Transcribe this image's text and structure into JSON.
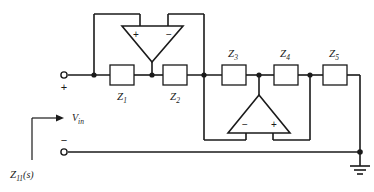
{
  "figure": {
    "type": "circuit-schematic",
    "background_color": "#ffffff",
    "line_color": "#1a1a1a"
  },
  "labels": {
    "input_voltage": "V",
    "input_voltage_sub": "in",
    "driving_point_impedance": "Z",
    "driving_point_impedance_sub": "11",
    "driving_point_impedance_arg": "(s)",
    "terminal_plus": "+",
    "terminal_minus": "−"
  },
  "impedances": [
    {
      "name": "Z1",
      "label": "Z",
      "subscript": "1",
      "label_position": "below",
      "x": 110,
      "y": 66,
      "w": 24,
      "h": 20
    },
    {
      "name": "Z2",
      "label": "Z",
      "subscript": "2",
      "label_position": "below",
      "x": 163,
      "y": 66,
      "w": 24,
      "h": 20
    },
    {
      "name": "Z3",
      "label": "Z",
      "subscript": "3",
      "label_position": "above",
      "x": 222,
      "y": 66,
      "w": 24,
      "h": 20
    },
    {
      "name": "Z4",
      "label": "Z",
      "subscript": "4",
      "label_position": "above",
      "x": 274,
      "y": 66,
      "w": 24,
      "h": 20
    },
    {
      "name": "Z5",
      "label": "Z",
      "subscript": "5",
      "label_position": "above",
      "x": 323,
      "y": 66,
      "w": 24,
      "h": 20
    }
  ],
  "opamps": [
    {
      "name": "opamp-top",
      "orientation": "pointing-down",
      "input_left": "+",
      "input_right": "−",
      "description": "Top operational amplifier, output at bottom apex feeding node between Z1 and Z2"
    },
    {
      "name": "opamp-bottom",
      "orientation": "pointing-up",
      "input_left": "−",
      "input_right": "+",
      "description": "Bottom operational amplifier, output at top apex feeding node between Z3 and Z4"
    }
  ],
  "nodes": [
    {
      "name": "node-input",
      "x": 94,
      "y": 75
    },
    {
      "name": "node-z1-z2",
      "x": 152,
      "y": 75
    },
    {
      "name": "node-z2-z3",
      "x": 204,
      "y": 75
    },
    {
      "name": "node-z3-z4",
      "x": 259,
      "y": 75
    },
    {
      "name": "node-z4-z5",
      "x": 310,
      "y": 75
    },
    {
      "name": "node-ground",
      "x": 360,
      "y": 152
    }
  ],
  "terminals": [
    {
      "name": "input-terminal-plus",
      "x": 63,
      "y": 75,
      "sign": "+"
    },
    {
      "name": "input-terminal-minus",
      "x": 63,
      "y": 152,
      "sign": "−"
    }
  ],
  "ground": {
    "name": "ground-symbol",
    "x": 360,
    "y": 152
  }
}
